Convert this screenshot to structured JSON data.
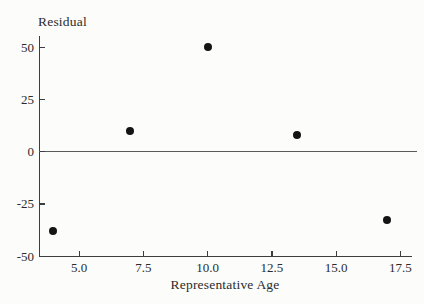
{
  "chart_data": {
    "type": "scatter",
    "title": "",
    "ylabel": "Residual",
    "xlabel": "Representative Age",
    "points": [
      {
        "x": 4,
        "y": -38
      },
      {
        "x": 7,
        "y": 10
      },
      {
        "x": 10,
        "y": 50
      },
      {
        "x": 13.5,
        "y": 8
      },
      {
        "x": 17,
        "y": -33
      }
    ],
    "y_ticks": [
      {
        "value": 50,
        "label": "50"
      },
      {
        "value": 25,
        "label": "25"
      },
      {
        "value": 0,
        "label": "0"
      },
      {
        "value": -25,
        "label": "-25"
      },
      {
        "value": -50,
        "label": "-50"
      }
    ],
    "x_ticks": [
      {
        "value": 5,
        "label": "5.0"
      },
      {
        "value": 7.5,
        "label": "7.5"
      },
      {
        "value": 10,
        "label": "10.0"
      },
      {
        "value": 12.5,
        "label": "12.5"
      },
      {
        "value": 15,
        "label": "15.0"
      },
      {
        "value": 17.5,
        "label": "17.5"
      }
    ],
    "xlim": [
      3.5,
      17.9
    ],
    "ylim": [
      -50,
      55
    ],
    "zero_reference_line": 0,
    "grid": false,
    "legend": "none",
    "marker": "filled-circle",
    "colors": {
      "background": "#fcfcfa",
      "ink": "#2b2b2b",
      "marker": "#141414"
    }
  }
}
